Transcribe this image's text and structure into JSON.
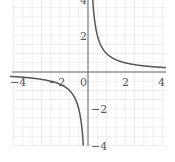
{
  "chart_data": {
    "type": "line",
    "title": "",
    "function": "y = 1/x",
    "xlabel": "",
    "ylabel": "",
    "xlim": [
      -4.2,
      4.2
    ],
    "ylim": [
      -4.1,
      4.2
    ],
    "grid": true,
    "grid_step": 0.5,
    "x_ticks": [
      -4,
      -2,
      0,
      2,
      4
    ],
    "x_tick_labels": [
      "−4",
      "−2",
      "0",
      "2",
      "4"
    ],
    "y_ticks": [
      2,
      -2,
      -4
    ],
    "y_tick_labels": [
      "2",
      "−2",
      "−4"
    ],
    "top_label": "4",
    "series": [
      {
        "name": "1/x (x>0)",
        "x": [
          0.25,
          0.5,
          1,
          2,
          3,
          4.2
        ],
        "y": [
          4,
          2,
          1,
          0.5,
          0.333,
          0.238
        ]
      },
      {
        "name": "1/x (x<0)",
        "x": [
          -4.2,
          -3,
          -2,
          -1,
          -0.5,
          -0.25
        ],
        "y": [
          -0.238,
          -0.333,
          -0.5,
          -1,
          -2,
          -4
        ]
      }
    ],
    "colors": {
      "curve": "#555555",
      "axis": "#666666",
      "grid": "#e6e6e6"
    }
  }
}
